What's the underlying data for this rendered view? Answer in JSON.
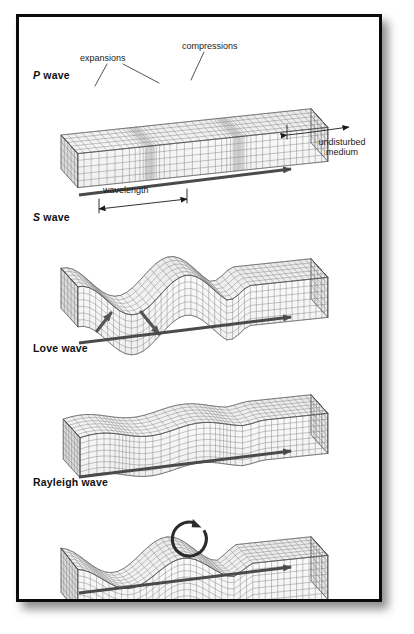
{
  "figure": {
    "background_color": "#ffffff",
    "frame_color": "#0a0a0a",
    "grid_line_color": "#6e6e6e",
    "face_fill_light": "#f7f7f7",
    "face_fill_mid": "#ededed",
    "face_fill_dark": "#dcdcdc",
    "arrow_color": "#4a4a4a"
  },
  "panels": [
    {
      "id": "p-wave",
      "label_prefix": "P",
      "label_rest": " wave",
      "label_full": "P wave",
      "label_x": 30,
      "label_y": 66,
      "wave_kind": "compressional",
      "direction_arrow": true
    },
    {
      "id": "s-wave",
      "label_prefix": "S",
      "label_rest": " wave",
      "label_full": "S wave",
      "label_x": 30,
      "label_y": 208,
      "wave_kind": "transverse-vertical",
      "direction_arrow": true
    },
    {
      "id": "love-wave",
      "label_prefix": "",
      "label_rest": "Love wave",
      "label_full": "Love wave",
      "label_x": 30,
      "label_y": 339,
      "wave_kind": "transverse-horizontal",
      "direction_arrow": true
    },
    {
      "id": "rayleigh-wave",
      "label_prefix": "",
      "label_rest": "Rayleigh wave",
      "label_full": "Rayleigh wave",
      "label_x": 30,
      "label_y": 473,
      "wave_kind": "retrograde-elliptical",
      "direction_arrow": true
    }
  ],
  "annotations": {
    "expansions": {
      "text": "expansions",
      "x": 95,
      "y": 49
    },
    "compressions": {
      "text": "compressions",
      "x": 199,
      "y": 37
    },
    "undisturbed_medium_line1": {
      "text": "undisturbed",
      "x": 322,
      "y": 133
    },
    "undisturbed_medium_line2": {
      "text": "medium",
      "x": 322,
      "y": 144
    },
    "wavelength": {
      "text": "wavelength",
      "x": 115,
      "y": 181
    }
  },
  "chart_data": {
    "type": "diagram",
    "panels": [
      "P wave",
      "S wave",
      "Love wave",
      "Rayleigh wave"
    ],
    "annotations": [
      "expansions",
      "compressions",
      "undisturbed medium",
      "wavelength"
    ]
  }
}
